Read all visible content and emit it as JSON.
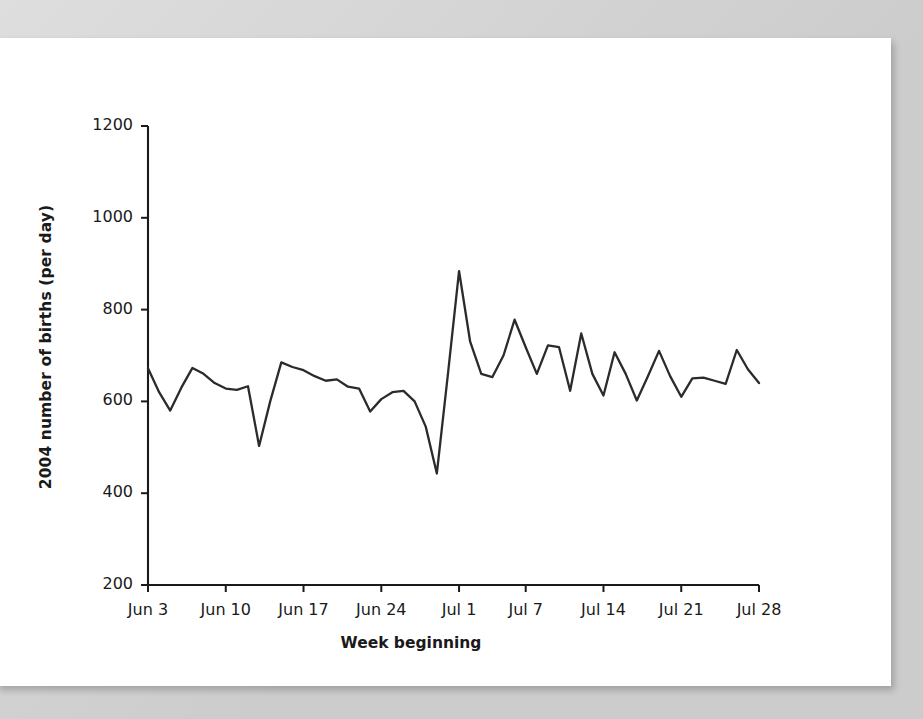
{
  "figure": {
    "background_color": "#ffffff",
    "page_background_color": "#cccccc",
    "line_color": "#2b2b2b",
    "axis_color": "#1a1a1a"
  },
  "chart_data": {
    "type": "line",
    "title": "",
    "xlabel": "Week beginning",
    "ylabel": "2004 number of births (per day)",
    "ylim": [
      200,
      1200
    ],
    "yticks": [
      200,
      400,
      600,
      800,
      1000,
      1200
    ],
    "ytick_labels": [
      "200",
      "400",
      "600",
      "800",
      "1000",
      "1200"
    ],
    "xtick_labels": [
      "Jun 3",
      "Jun 10",
      "Jun 17",
      "Jun 24",
      "Jul 1",
      "Jul 7",
      "Jul 14",
      "Jul 21",
      "Jul 28"
    ],
    "xtick_days": [
      0,
      7,
      14,
      21,
      28,
      34,
      41,
      48,
      55
    ],
    "xlim_days": [
      0,
      55
    ],
    "grid": false,
    "legend": null,
    "series": [
      {
        "name": "2004 daily births",
        "x": [
          0,
          1,
          2,
          3,
          4,
          5,
          6,
          7,
          8,
          9,
          10,
          11,
          12,
          13,
          14,
          15,
          16,
          17,
          18,
          19,
          20,
          21,
          22,
          23,
          24,
          25,
          26,
          27,
          28,
          29,
          30,
          31,
          32,
          33,
          34,
          35,
          36,
          37,
          38,
          39,
          40,
          41,
          42,
          43,
          44,
          45,
          46,
          47,
          48,
          49,
          50,
          51,
          52,
          53,
          54,
          55
        ],
        "x_labels": [
          "Jun 3",
          "Jun 4",
          "Jun 5",
          "Jun 6",
          "Jun 7",
          "Jun 8",
          "Jun 9",
          "Jun 10",
          "Jun 11",
          "Jun 12",
          "Jun 13",
          "Jun 14",
          "Jun 15",
          "Jun 16",
          "Jun 17",
          "Jun 18",
          "Jun 19",
          "Jun 20",
          "Jun 21",
          "Jun 22",
          "Jun 23",
          "Jun 24",
          "Jun 25",
          "Jun 26",
          "Jun 27",
          "Jun 28",
          "Jun 29",
          "Jun 30",
          "Jul 1",
          "Jul 2",
          "Jul 3",
          "Jul 4",
          "Jul 5",
          "Jul 6",
          "Jul 7",
          "Jul 8",
          "Jul 9",
          "Jul 10",
          "Jul 11",
          "Jul 12",
          "Jul 13",
          "Jul 14",
          "Jul 15",
          "Jul 16",
          "Jul 17",
          "Jul 18",
          "Jul 19",
          "Jul 20",
          "Jul 21",
          "Jul 22",
          "Jul 23",
          "Jul 24",
          "Jul 25",
          "Jul 26",
          "Jul 27",
          "Jul 28"
        ],
        "values": [
          672,
          620,
          580,
          630,
          673,
          660,
          640,
          628,
          625,
          633,
          503,
          600,
          685,
          675,
          668,
          655,
          645,
          648,
          632,
          628,
          578,
          605,
          620,
          623,
          600,
          545,
          443,
          660,
          884,
          730,
          660,
          653,
          700,
          778,
          718,
          660,
          722,
          718,
          623,
          748,
          660,
          613,
          707,
          660,
          602,
          655,
          710,
          655,
          610,
          650,
          652,
          645,
          638,
          712,
          670,
          640
        ]
      }
    ]
  }
}
